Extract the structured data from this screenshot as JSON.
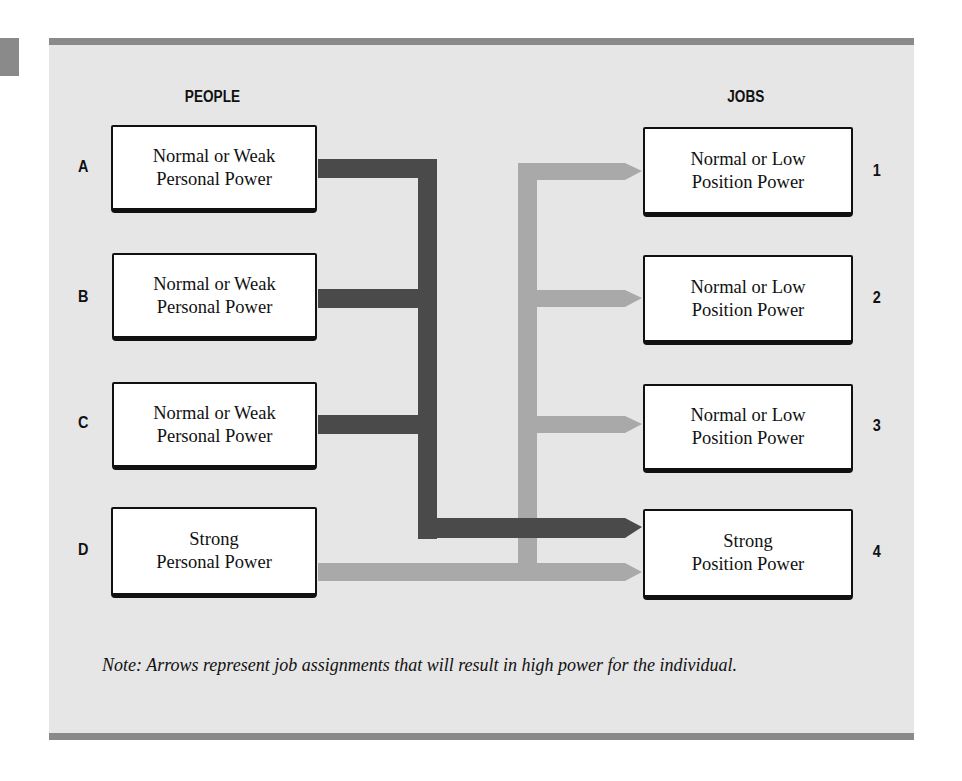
{
  "headings": {
    "people": "PEOPLE",
    "jobs": "JOBS"
  },
  "people": [
    {
      "label": "A",
      "line1": "Normal or Weak",
      "line2": "Personal Power"
    },
    {
      "label": "B",
      "line1": "Normal or Weak",
      "line2": "Personal Power"
    },
    {
      "label": "C",
      "line1": "Normal or Weak",
      "line2": "Personal Power"
    },
    {
      "label": "D",
      "line1": "Strong",
      "line2": "Personal Power"
    }
  ],
  "jobs": [
    {
      "label": "1",
      "line1": "Normal or Low",
      "line2": "Position Power"
    },
    {
      "label": "2",
      "line1": "Normal or Low",
      "line2": "Position Power"
    },
    {
      "label": "3",
      "line1": "Normal or Low",
      "line2": "Position Power"
    },
    {
      "label": "4",
      "line1": "Strong",
      "line2": "Position Power"
    }
  ],
  "connections": [
    {
      "from": "A",
      "to": "4",
      "style": "dark"
    },
    {
      "from": "B",
      "to": "4",
      "style": "dark"
    },
    {
      "from": "C",
      "to": "4",
      "style": "dark"
    },
    {
      "from": "D",
      "to": "1",
      "style": "light"
    },
    {
      "from": "D",
      "to": "2",
      "style": "light"
    },
    {
      "from": "D",
      "to": "3",
      "style": "light"
    },
    {
      "from": "D",
      "to": "4",
      "style": "light"
    }
  ],
  "colors": {
    "dark_arrow": "#4a4a4a",
    "light_arrow": "#a9a9a9",
    "panel": "#e6e6e6",
    "rule": "#8a8a8a"
  },
  "note": "Note:  Arrows represent job assignments that will result in high power for the individual."
}
